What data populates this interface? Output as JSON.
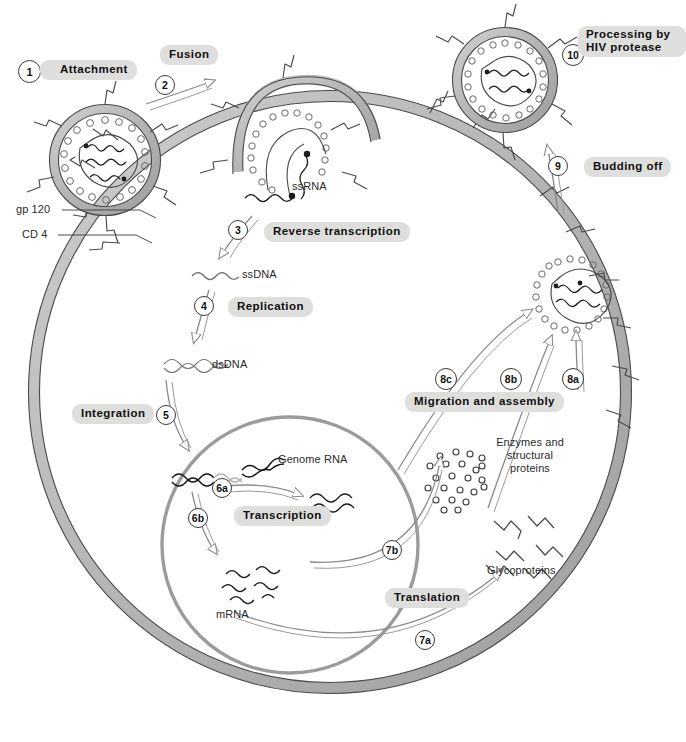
{
  "figure": {
    "caption": ""
  },
  "colors": {
    "membrane_fill": "#b9b9b9",
    "membrane_stroke": "#3f3f3f",
    "nucleus_stroke": "#8e8e8e",
    "pill_bg": "#dededc",
    "arrow_stroke": "#8a8a8a",
    "text": "#101010",
    "plain_text": "#2a2a2a",
    "background": "#ffffff"
  },
  "steps": [
    {
      "id": "1",
      "label": "Attachment",
      "style": "pill"
    },
    {
      "id": "2",
      "label": "Fusion",
      "style": "pill"
    },
    {
      "id": "3",
      "label": "Reverse transcription",
      "style": "pill"
    },
    {
      "id": "4",
      "label": "Replication",
      "style": "pill"
    },
    {
      "id": "5",
      "label": "Integration",
      "style": "pill"
    },
    {
      "id": "6a",
      "label": "Transcription",
      "style": "pill"
    },
    {
      "id": "6b",
      "label": "Transcription",
      "style": "pill"
    },
    {
      "id": "7a",
      "label": "Translation",
      "style": "pill"
    },
    {
      "id": "7b",
      "label": "Translation",
      "style": "pill"
    },
    {
      "id": "8a",
      "label": "Migration and assembly",
      "style": "pill"
    },
    {
      "id": "8b",
      "label": "Migration and assembly",
      "style": "pill"
    },
    {
      "id": "8c",
      "label": "Migration and assembly",
      "style": "pill"
    },
    {
      "id": "9",
      "label": "Budding off",
      "style": "pill"
    },
    {
      "id": "10",
      "label": "Processing by HIV protease",
      "style": "pill"
    }
  ],
  "labels": {
    "attachment": "Attachment",
    "fusion": "Fusion",
    "reverse_transcription": "Reverse transcription",
    "replication": "Replication",
    "integration": "Integration",
    "transcription": "Transcription",
    "translation": "Translation",
    "migration_assembly": "Migration and assembly",
    "budding_off": "Budding off",
    "processing_line1": "Processing by",
    "processing_line2": "HIV protease"
  },
  "numbers": {
    "s1": "1",
    "s2": "2",
    "s3": "3",
    "s4": "4",
    "s5": "5",
    "s6a": "6a",
    "s6b": "6b",
    "s7a": "7a",
    "s7b": "7b",
    "s8a": "8a",
    "s8b": "8b",
    "s8c": "8c",
    "s9": "9",
    "s10": "10"
  },
  "molecules": {
    "gp120": "gp 120",
    "cd4": "CD 4",
    "ssrna": "ssRNA",
    "ssdna": "ssDNA",
    "dsdna": "dsDNA",
    "genome_rna": "Genome RNA",
    "mrna": "mRNA",
    "enzymes_line1": "Enzymes and",
    "enzymes_line2": "structural",
    "enzymes_line3": "proteins",
    "glycoproteins": "Glycoproteins"
  },
  "diagram": {
    "cell_membrane": "host cell plasma membrane",
    "nucleus": "cell nucleus",
    "virions": [
      "free virion attaching",
      "fusing virion",
      "budding virion",
      "mature virion"
    ]
  }
}
